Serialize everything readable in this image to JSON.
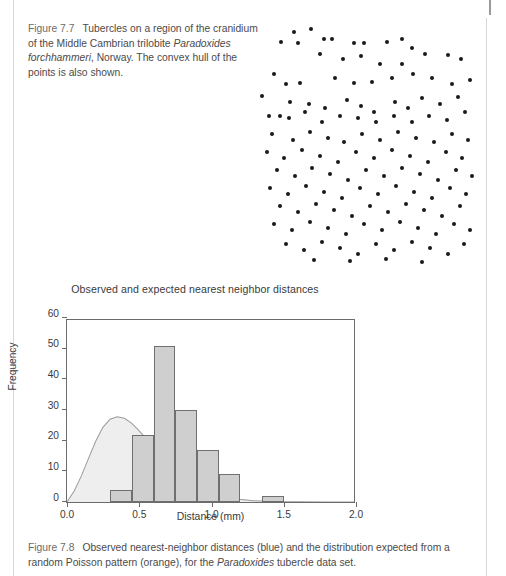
{
  "page": {
    "background": "#ffffff",
    "rule_color": "#d8d8d8"
  },
  "figure_77": {
    "label": "Figure 7.7",
    "caption_part1": "Tubercles on a region of the cranidium of the Middle Cambrian trilobite ",
    "caption_italic": "Paradoxides forchhammeri",
    "caption_part2": ", Norway. The convex hull of the points is also shown."
  },
  "figure_78": {
    "label": "Figure 7.8",
    "caption_part1": "Observed nearest-neighbor distances (blue) and the distribution expected from a random Poisson pattern (orange), for the ",
    "caption_italic": "Paradoxides",
    "caption_part2": " tubercle data set."
  },
  "scatter": {
    "name": "tubercle-point-pattern",
    "point_color": "#1a1a1a",
    "point_count": 141,
    "points": [
      [
        32,
        20
      ],
      [
        49,
        17
      ],
      [
        19,
        30
      ],
      [
        36,
        31
      ],
      [
        62,
        27
      ],
      [
        70,
        27
      ],
      [
        92,
        31
      ],
      [
        102,
        31
      ],
      [
        125,
        30
      ],
      [
        140,
        27
      ],
      [
        150,
        36
      ],
      [
        58,
        42
      ],
      [
        81,
        47
      ],
      [
        99,
        44
      ],
      [
        118,
        52
      ],
      [
        140,
        52
      ],
      [
        163,
        42
      ],
      [
        186,
        43
      ],
      [
        199,
        47
      ],
      [
        12,
        62
      ],
      [
        24,
        72
      ],
      [
        38,
        71
      ],
      [
        73,
        66
      ],
      [
        92,
        71
      ],
      [
        110,
        70
      ],
      [
        130,
        66
      ],
      [
        151,
        62
      ],
      [
        170,
        66
      ],
      [
        190,
        72
      ],
      [
        208,
        68
      ],
      [
        0,
        84
      ],
      [
        28,
        90
      ],
      [
        47,
        92
      ],
      [
        63,
        96
      ],
      [
        85,
        88
      ],
      [
        99,
        94
      ],
      [
        112,
        100
      ],
      [
        133,
        90
      ],
      [
        146,
        96
      ],
      [
        160,
        86
      ],
      [
        178,
        92
      ],
      [
        196,
        85
      ],
      [
        7,
        104
      ],
      [
        18,
        104
      ],
      [
        27,
        106
      ],
      [
        43,
        100
      ],
      [
        60,
        110
      ],
      [
        78,
        104
      ],
      [
        96,
        106
      ],
      [
        114,
        110
      ],
      [
        132,
        104
      ],
      [
        150,
        110
      ],
      [
        167,
        104
      ],
      [
        185,
        108
      ],
      [
        203,
        100
      ],
      [
        10,
        122
      ],
      [
        31,
        128
      ],
      [
        48,
        120
      ],
      [
        66,
        126
      ],
      [
        82,
        130
      ],
      [
        100,
        122
      ],
      [
        118,
        128
      ],
      [
        136,
        120
      ],
      [
        154,
        126
      ],
      [
        172,
        130
      ],
      [
        190,
        122
      ],
      [
        206,
        128
      ],
      [
        5,
        140
      ],
      [
        22,
        146
      ],
      [
        40,
        138
      ],
      [
        58,
        144
      ],
      [
        76,
        150
      ],
      [
        94,
        140
      ],
      [
        112,
        146
      ],
      [
        130,
        138
      ],
      [
        148,
        144
      ],
      [
        166,
        150
      ],
      [
        184,
        140
      ],
      [
        200,
        146
      ],
      [
        15,
        158
      ],
      [
        33,
        164
      ],
      [
        50,
        156
      ],
      [
        68,
        162
      ],
      [
        86,
        168
      ],
      [
        104,
        158
      ],
      [
        122,
        164
      ],
      [
        140,
        156
      ],
      [
        158,
        162
      ],
      [
        176,
        168
      ],
      [
        194,
        158
      ],
      [
        210,
        164
      ],
      [
        8,
        176
      ],
      [
        26,
        182
      ],
      [
        44,
        174
      ],
      [
        62,
        180
      ],
      [
        80,
        186
      ],
      [
        98,
        176
      ],
      [
        116,
        182
      ],
      [
        134,
        174
      ],
      [
        152,
        180
      ],
      [
        170,
        186
      ],
      [
        188,
        176
      ],
      [
        204,
        182
      ],
      [
        18,
        194
      ],
      [
        36,
        200
      ],
      [
        54,
        192
      ],
      [
        72,
        198
      ],
      [
        90,
        204
      ],
      [
        108,
        194
      ],
      [
        126,
        200
      ],
      [
        144,
        192
      ],
      [
        162,
        198
      ],
      [
        180,
        204
      ],
      [
        198,
        194
      ],
      [
        12,
        212
      ],
      [
        30,
        218
      ],
      [
        48,
        210
      ],
      [
        66,
        216
      ],
      [
        84,
        222
      ],
      [
        102,
        212
      ],
      [
        120,
        218
      ],
      [
        138,
        210
      ],
      [
        156,
        216
      ],
      [
        174,
        222
      ],
      [
        192,
        212
      ],
      [
        208,
        218
      ],
      [
        24,
        232
      ],
      [
        42,
        238
      ],
      [
        60,
        230
      ],
      [
        78,
        236
      ],
      [
        96,
        242
      ],
      [
        114,
        232
      ],
      [
        132,
        238
      ],
      [
        150,
        230
      ],
      [
        168,
        236
      ],
      [
        186,
        242
      ],
      [
        202,
        232
      ],
      [
        52,
        248
      ],
      [
        88,
        249
      ],
      [
        124,
        247
      ],
      [
        160,
        250
      ]
    ]
  },
  "chart_data": {
    "type": "bar",
    "name": "nearest-neighbor-distance-histogram",
    "title": "Observed and expected nearest neighbor distances",
    "xlabel": "Distance (mm)",
    "ylabel": "Frequency",
    "xlim": [
      0.0,
      2.0
    ],
    "ylim": [
      0,
      60
    ],
    "grid": false,
    "xticks": [
      "0.0",
      "0.5",
      "1.0",
      "1.5",
      "2.0"
    ],
    "xtick_values": [
      0.0,
      0.5,
      1.0,
      1.5,
      2.0
    ],
    "yticks": [
      "0",
      "10",
      "20",
      "30",
      "40",
      "50",
      "60"
    ],
    "ytick_values": [
      0,
      10,
      20,
      30,
      40,
      50,
      60
    ],
    "bar_fill": "#cfcfcf",
    "bar_stroke": "#6f6f6f",
    "curve_fill": "#eeeeee",
    "curve_stroke": "#9a9a9a",
    "bin_width": 0.15,
    "bin_edges": [
      0.3,
      0.45,
      0.6,
      0.75,
      0.9,
      1.05,
      1.2,
      1.35,
      1.5
    ],
    "categories": [
      "0.30-0.45",
      "0.45-0.60",
      "0.60-0.75",
      "0.75-0.90",
      "0.90-1.05",
      "1.05-1.20",
      "1.20-1.35",
      "1.35-1.50"
    ],
    "values": [
      4,
      22,
      51,
      30,
      17,
      9,
      0,
      2
    ],
    "series": [
      {
        "name": "Observed nearest-neighbor distances",
        "legend_color_word": "blue",
        "values": [
          4,
          22,
          51,
          30,
          17,
          9,
          0,
          2
        ]
      },
      {
        "name": "Expected from random Poisson pattern",
        "legend_color_word": "orange",
        "type": "curve",
        "x": [
          0.0,
          0.05,
          0.1,
          0.15,
          0.2,
          0.25,
          0.3,
          0.35,
          0.4,
          0.45,
          0.5,
          0.55,
          0.6,
          0.65,
          0.7,
          0.75,
          0.8,
          0.85,
          0.9,
          0.95,
          1.0,
          1.05,
          1.1,
          1.15,
          1.2,
          1.25,
          1.3,
          1.35,
          1.4,
          1.5,
          1.6,
          1.8,
          2.0
        ],
        "y": [
          0.0,
          3.6,
          8.6,
          14.4,
          20.0,
          24.6,
          27.3,
          28.1,
          27.6,
          26.0,
          23.6,
          21.0,
          18.3,
          15.6,
          13.1,
          10.8,
          8.8,
          7.0,
          5.5,
          4.3,
          3.3,
          2.5,
          1.8,
          1.3,
          0.9,
          0.65,
          0.45,
          0.3,
          0.2,
          0.1,
          0.05,
          0.0,
          0.0
        ]
      }
    ]
  }
}
